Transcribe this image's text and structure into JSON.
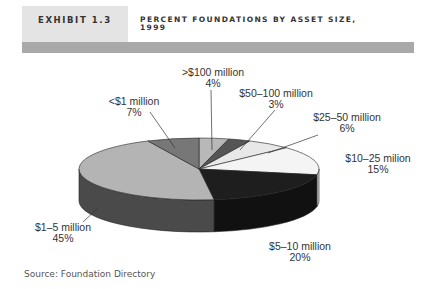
{
  "header": {
    "exhibit": "EXHIBIT 1.3",
    "title_line1": "PERCENT FOUNDATIONS BY ASSET SIZE,",
    "title_line2": "1999"
  },
  "source": "Source: Foundation Directory",
  "chart_data": {
    "type": "pie",
    "style": "3d",
    "title": "Percent Foundations by Asset Size, 1999",
    "start": "top, clockwise",
    "slices": [
      {
        "label": ">$100 million",
        "value": 4,
        "value_label": "4%",
        "color": "#b8b8b8",
        "side": "#8c8c8c"
      },
      {
        "label": "$50–100 million",
        "value": 3,
        "value_label": "3%",
        "color": "#555555",
        "side": "#3a3a3a"
      },
      {
        "label": "$25–50 million",
        "value": 6,
        "value_label": "6%",
        "color": "#e8e8e8",
        "side": "#c4c4c4"
      },
      {
        "label": "$10–25 milion",
        "value": 15,
        "value_label": "15%",
        "color": "#f4f4f4",
        "side": "#d0d0d0"
      },
      {
        "label": "$5–10 million",
        "value": 20,
        "value_label": "20%",
        "color": "#1e1e1e",
        "side": "#111111"
      },
      {
        "label": "$1–5 million",
        "value": 45,
        "value_label": "45%",
        "color": "#b4b4b4",
        "side": "#4a4a4a"
      },
      {
        "label": "<$1 million",
        "value": 7,
        "value_label": "7%",
        "color": "#777777",
        "side": "#555555"
      }
    ]
  }
}
